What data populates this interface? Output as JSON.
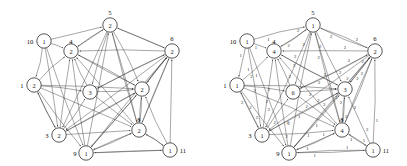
{
  "figure": {
    "type": "directed-graph-pair",
    "panel_count": 2
  },
  "layout": {
    "positions": {
      "5": {
        "cx": 110,
        "cy": 25
      },
      "10": {
        "cx": 44,
        "cy": 41
      },
      "4": {
        "cx": 71,
        "cy": 51
      },
      "6": {
        "cx": 172,
        "cy": 51
      },
      "1": {
        "cx": 34,
        "cy": 85
      },
      "7": {
        "cx": 90,
        "cy": 92
      },
      "2": {
        "cx": 142,
        "cy": 89
      },
      "3": {
        "cx": 59,
        "cy": 135
      },
      "8": {
        "cx": 139,
        "cy": 130
      },
      "9": {
        "cx": 86,
        "cy": 153
      },
      "11": {
        "cx": 170,
        "cy": 150
      }
    },
    "label_offsets": {
      "5": {
        "dx": 0,
        "dy": -13
      },
      "10": {
        "dx": -14,
        "dy": 0
      },
      "4": {
        "dx": 0,
        "dy": -10
      },
      "6": {
        "dx": 0,
        "dy": -13
      },
      "1": {
        "dx": -12,
        "dy": 0
      },
      "7": {
        "dx": 0,
        "dy": 0
      },
      "2": {
        "dx": 0,
        "dy": 0
      },
      "3": {
        "dx": -12,
        "dy": 0
      },
      "8": {
        "dx": 0,
        "dy": -11
      },
      "9": {
        "dx": -11,
        "dy": 0
      },
      "11": {
        "dx": 13,
        "dy": 0
      }
    },
    "node_radius": 7.2,
    "show_node_id": {
      "5": true,
      "10": true,
      "4": true,
      "6": true,
      "1": true,
      "7": false,
      "2": false,
      "3": true,
      "8": true,
      "9": true,
      "11": true
    }
  },
  "panels": [
    {
      "id": "left",
      "name": "graph-left",
      "show_weights": false,
      "nodes": [
        {
          "id": "5",
          "label": "5",
          "value": "2"
        },
        {
          "id": "10",
          "label": "10",
          "value": "1"
        },
        {
          "id": "4",
          "label": "4",
          "value": "2"
        },
        {
          "id": "6",
          "label": "6",
          "value": "2"
        },
        {
          "id": "1",
          "label": "1",
          "value": "2"
        },
        {
          "id": "7",
          "label": "7",
          "value": "3"
        },
        {
          "id": "2",
          "label": "2",
          "value": "2"
        },
        {
          "id": "3",
          "label": "3",
          "value": "2"
        },
        {
          "id": "8",
          "label": "8",
          "value": "2"
        },
        {
          "id": "9",
          "label": "9",
          "value": "1"
        },
        {
          "id": "11",
          "label": "11",
          "value": "1"
        }
      ],
      "edges": [
        {
          "from": "10",
          "to": "5",
          "weight": ""
        },
        {
          "from": "10",
          "to": "4",
          "weight": ""
        },
        {
          "from": "10",
          "to": "1",
          "weight": ""
        },
        {
          "from": "10",
          "to": "3",
          "weight": ""
        },
        {
          "from": "10",
          "to": "9",
          "weight": ""
        },
        {
          "from": "5",
          "to": "4",
          "weight": ""
        },
        {
          "from": "5",
          "to": "6",
          "weight": ""
        },
        {
          "from": "5",
          "to": "7",
          "weight": ""
        },
        {
          "from": "5",
          "to": "2",
          "weight": ""
        },
        {
          "from": "5",
          "to": "8",
          "weight": ""
        },
        {
          "from": "5",
          "to": "3",
          "weight": ""
        },
        {
          "from": "6",
          "to": "5",
          "weight": ""
        },
        {
          "from": "6",
          "to": "4",
          "weight": ""
        },
        {
          "from": "6",
          "to": "2",
          "weight": ""
        },
        {
          "from": "6",
          "to": "7",
          "weight": ""
        },
        {
          "from": "6",
          "to": "8",
          "weight": ""
        },
        {
          "from": "6",
          "to": "3",
          "weight": ""
        },
        {
          "from": "6",
          "to": "9",
          "weight": ""
        },
        {
          "from": "11",
          "to": "6",
          "weight": ""
        },
        {
          "from": "11",
          "to": "8",
          "weight": ""
        },
        {
          "from": "11",
          "to": "9",
          "weight": ""
        },
        {
          "from": "11",
          "to": "2",
          "weight": ""
        },
        {
          "from": "1",
          "to": "4",
          "weight": ""
        },
        {
          "from": "1",
          "to": "3",
          "weight": ""
        },
        {
          "from": "1",
          "to": "7",
          "weight": ""
        },
        {
          "from": "1",
          "to": "2",
          "weight": ""
        },
        {
          "from": "1",
          "to": "8",
          "weight": ""
        },
        {
          "from": "3",
          "to": "4",
          "weight": ""
        },
        {
          "from": "3",
          "to": "7",
          "weight": ""
        },
        {
          "from": "3",
          "to": "2",
          "weight": ""
        },
        {
          "from": "3",
          "to": "8",
          "weight": ""
        },
        {
          "from": "3",
          "to": "1",
          "weight": ""
        },
        {
          "from": "9",
          "to": "4",
          "weight": ""
        },
        {
          "from": "9",
          "to": "5",
          "weight": ""
        },
        {
          "from": "9",
          "to": "2",
          "weight": ""
        },
        {
          "from": "9",
          "to": "8",
          "weight": ""
        },
        {
          "from": "9",
          "to": "6",
          "weight": ""
        },
        {
          "from": "9",
          "to": "11",
          "weight": ""
        },
        {
          "from": "7",
          "to": "4",
          "weight": ""
        },
        {
          "from": "7",
          "to": "2",
          "weight": ""
        },
        {
          "from": "7",
          "to": "8",
          "weight": ""
        },
        {
          "from": "7",
          "to": "6",
          "weight": ""
        },
        {
          "from": "2",
          "to": "4",
          "weight": ""
        },
        {
          "from": "2",
          "to": "8",
          "weight": ""
        },
        {
          "from": "2",
          "to": "6",
          "weight": ""
        },
        {
          "from": "2",
          "to": "3",
          "weight": ""
        },
        {
          "from": "8",
          "to": "4",
          "weight": ""
        },
        {
          "from": "8",
          "to": "2",
          "weight": ""
        },
        {
          "from": "8",
          "to": "6",
          "weight": ""
        },
        {
          "from": "8",
          "to": "9",
          "weight": ""
        },
        {
          "from": "8",
          "to": "11",
          "weight": ""
        },
        {
          "from": "8",
          "to": "5",
          "weight": ""
        },
        {
          "from": "4",
          "to": "5",
          "weight": ""
        },
        {
          "from": "4",
          "to": "2",
          "weight": ""
        },
        {
          "from": "1",
          "to": "9",
          "weight": ""
        }
      ]
    },
    {
      "id": "right",
      "name": "graph-right",
      "show_weights": true,
      "nodes": [
        {
          "id": "5",
          "label": "5",
          "value": "1"
        },
        {
          "id": "10",
          "label": "10",
          "value": "1"
        },
        {
          "id": "4",
          "label": "4",
          "value": "4"
        },
        {
          "id": "6",
          "label": "6",
          "value": "2"
        },
        {
          "id": "1",
          "label": "1",
          "value": "1"
        },
        {
          "id": "7",
          "label": "7",
          "value": "6"
        },
        {
          "id": "2",
          "label": "2",
          "value": "3"
        },
        {
          "id": "3",
          "label": "3",
          "value": "1"
        },
        {
          "id": "8",
          "label": "8",
          "value": "4"
        },
        {
          "id": "9",
          "label": "9",
          "value": "1"
        },
        {
          "id": "11",
          "label": "11",
          "value": "1"
        }
      ],
      "edges": [
        {
          "from": "10",
          "to": "5",
          "weight": "1"
        },
        {
          "from": "10",
          "to": "4",
          "weight": "1"
        },
        {
          "from": "10",
          "to": "1",
          "weight": "1"
        },
        {
          "from": "10",
          "to": "3",
          "weight": "1"
        },
        {
          "from": "10",
          "to": "9",
          "weight": "1"
        },
        {
          "from": "5",
          "to": "4",
          "weight": "2"
        },
        {
          "from": "5",
          "to": "6",
          "weight": "2"
        },
        {
          "from": "5",
          "to": "7",
          "weight": "2"
        },
        {
          "from": "5",
          "to": "2",
          "weight": "2"
        },
        {
          "from": "5",
          "to": "8",
          "weight": "2"
        },
        {
          "from": "5",
          "to": "3",
          "weight": "2"
        },
        {
          "from": "6",
          "to": "5",
          "weight": "2"
        },
        {
          "from": "6",
          "to": "4",
          "weight": "2"
        },
        {
          "from": "6",
          "to": "2",
          "weight": "2"
        },
        {
          "from": "6",
          "to": "7",
          "weight": "2"
        },
        {
          "from": "6",
          "to": "8",
          "weight": "2"
        },
        {
          "from": "6",
          "to": "3",
          "weight": "2"
        },
        {
          "from": "6",
          "to": "9",
          "weight": "2"
        },
        {
          "from": "11",
          "to": "6",
          "weight": "1"
        },
        {
          "from": "11",
          "to": "8",
          "weight": "1"
        },
        {
          "from": "11",
          "to": "9",
          "weight": "1"
        },
        {
          "from": "11",
          "to": "2",
          "weight": "2"
        },
        {
          "from": "1",
          "to": "4",
          "weight": "2"
        },
        {
          "from": "1",
          "to": "3",
          "weight": "2"
        },
        {
          "from": "1",
          "to": "7",
          "weight": "2"
        },
        {
          "from": "1",
          "to": "2",
          "weight": "2"
        },
        {
          "from": "1",
          "to": "8",
          "weight": "2"
        },
        {
          "from": "3",
          "to": "4",
          "weight": "2"
        },
        {
          "from": "3",
          "to": "7",
          "weight": "2"
        },
        {
          "from": "3",
          "to": "2",
          "weight": "2"
        },
        {
          "from": "3",
          "to": "8",
          "weight": "2"
        },
        {
          "from": "3",
          "to": "1",
          "weight": "2"
        },
        {
          "from": "9",
          "to": "4",
          "weight": "2"
        },
        {
          "from": "9",
          "to": "5",
          "weight": "1"
        },
        {
          "from": "9",
          "to": "2",
          "weight": "1"
        },
        {
          "from": "9",
          "to": "8",
          "weight": "1"
        },
        {
          "from": "9",
          "to": "6",
          "weight": "1"
        },
        {
          "from": "9",
          "to": "11",
          "weight": "1"
        },
        {
          "from": "7",
          "to": "4",
          "weight": "2"
        },
        {
          "from": "7",
          "to": "2",
          "weight": "2"
        },
        {
          "from": "7",
          "to": "8",
          "weight": "2"
        },
        {
          "from": "7",
          "to": "6",
          "weight": "2"
        },
        {
          "from": "2",
          "to": "4",
          "weight": "2"
        },
        {
          "from": "2",
          "to": "8",
          "weight": "2"
        },
        {
          "from": "2",
          "to": "6",
          "weight": "2"
        },
        {
          "from": "2",
          "to": "3",
          "weight": "2"
        },
        {
          "from": "8",
          "to": "4",
          "weight": "3"
        },
        {
          "from": "8",
          "to": "2",
          "weight": "2"
        },
        {
          "from": "8",
          "to": "6",
          "weight": "2"
        },
        {
          "from": "8",
          "to": "9",
          "weight": "1"
        },
        {
          "from": "8",
          "to": "11",
          "weight": "1"
        },
        {
          "from": "8",
          "to": "5",
          "weight": "2"
        },
        {
          "from": "4",
          "to": "5",
          "weight": "2"
        },
        {
          "from": "4",
          "to": "2",
          "weight": "2"
        },
        {
          "from": "1",
          "to": "9",
          "weight": "2"
        }
      ]
    }
  ]
}
